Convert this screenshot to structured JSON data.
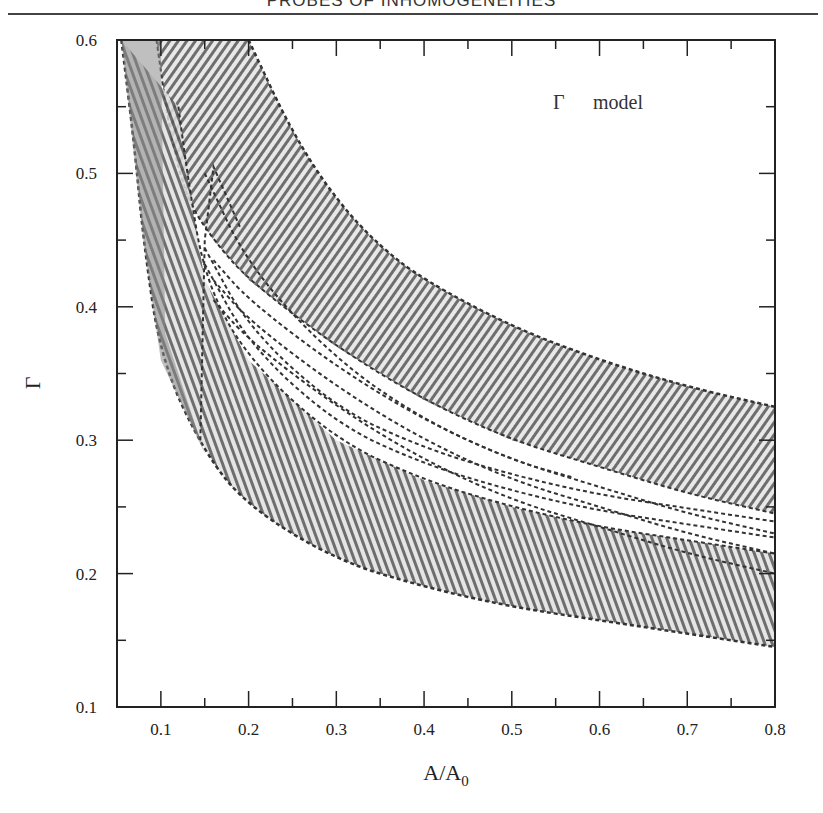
{
  "page": {
    "running_head": "PROBES OF INHOMOGENEITIES"
  },
  "chart_data": {
    "type": "area",
    "title": "",
    "annotation": "Γ  model",
    "annotation_symbol": "Γ",
    "annotation_text": "model",
    "xlabel": "A/A",
    "xlabel_subscript": "0",
    "ylabel": "Γ",
    "xlim": [
      0.05,
      0.8
    ],
    "ylim": [
      0.1,
      0.6
    ],
    "grid": false,
    "legend": "none",
    "x_ticks": [
      "0.1",
      "0.2",
      "0.3",
      "0.4",
      "0.5",
      "0.6",
      "0.7",
      "0.8"
    ],
    "x_tick_values": [
      0.1,
      0.2,
      0.3,
      0.4,
      0.5,
      0.6,
      0.7,
      0.8
    ],
    "y_ticks": [
      "0.1",
      "0.2",
      "0.3",
      "0.4",
      "0.5",
      "0.6"
    ],
    "y_tick_values": [
      0.1,
      0.2,
      0.3,
      0.4,
      0.5,
      0.6
    ],
    "series": [
      {
        "name": "upper band outer edge",
        "x": [
          0.2,
          0.25,
          0.3,
          0.35,
          0.4,
          0.5,
          0.6,
          0.7,
          0.8
        ],
        "y": [
          0.6,
          0.53,
          0.48,
          0.445,
          0.42,
          0.385,
          0.36,
          0.34,
          0.325
        ]
      },
      {
        "name": "upper band inner edge",
        "x": [
          0.095,
          0.11,
          0.13,
          0.16,
          0.2,
          0.3,
          0.4,
          0.5,
          0.6,
          0.7,
          0.8
        ],
        "y": [
          0.6,
          0.53,
          0.48,
          0.45,
          0.42,
          0.37,
          0.33,
          0.3,
          0.28,
          0.26,
          0.245
        ]
      },
      {
        "name": "lower band inner edge",
        "x": [
          0.12,
          0.13,
          0.15,
          0.2,
          0.3,
          0.4,
          0.5,
          0.6,
          0.7,
          0.8
        ],
        "y": [
          0.55,
          0.5,
          0.42,
          0.36,
          0.3,
          0.27,
          0.25,
          0.235,
          0.225,
          0.215
        ]
      },
      {
        "name": "lower band outer edge",
        "x": [
          0.055,
          0.07,
          0.08,
          0.1,
          0.15,
          0.2,
          0.3,
          0.4,
          0.5,
          0.6,
          0.7,
          0.8
        ],
        "y": [
          0.6,
          0.52,
          0.45,
          0.36,
          0.29,
          0.25,
          0.21,
          0.19,
          0.175,
          0.165,
          0.155,
          0.145
        ]
      },
      {
        "name": "central contour terminating near A/A0=0.57",
        "x": [
          0.15,
          0.2,
          0.3,
          0.4,
          0.5,
          0.57
        ],
        "y": [
          0.5,
          0.43,
          0.36,
          0.315,
          0.285,
          0.272
        ]
      }
    ]
  }
}
